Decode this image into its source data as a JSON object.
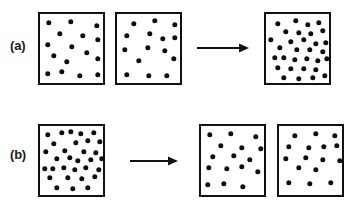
{
  "figure": {
    "background_color": "#ffffff",
    "box_border_color": "#111111",
    "particle_color": "#0d0d0d",
    "label_color": "#1a1a1a",
    "particle_diameter": 5.4,
    "canvas": {
      "width": 361,
      "height": 205
    }
  },
  "rows": [
    {
      "id": "row-a",
      "label": "(a)",
      "label_pos": {
        "x": 10,
        "y": 38
      },
      "description": "Two separate containers of particles combine into one container",
      "boxes": [
        {
          "id": "a-box-1",
          "role": "source-left",
          "rect": {
            "x": 38,
            "y": 12,
            "w": 67,
            "h": 73
          },
          "count": 15,
          "particles": [
            {
              "x": 9,
              "y": 9
            },
            {
              "x": 31,
              "y": 8
            },
            {
              "x": 57,
              "y": 12
            },
            {
              "x": 20,
              "y": 20
            },
            {
              "x": 43,
              "y": 22
            },
            {
              "x": 8,
              "y": 31
            },
            {
              "x": 58,
              "y": 26
            },
            {
              "x": 32,
              "y": 33
            },
            {
              "x": 14,
              "y": 42
            },
            {
              "x": 47,
              "y": 39
            },
            {
              "x": 27,
              "y": 48
            },
            {
              "x": 58,
              "y": 45
            },
            {
              "x": 8,
              "y": 60
            },
            {
              "x": 22,
              "y": 58
            },
            {
              "x": 40,
              "y": 62
            },
            {
              "x": 58,
              "y": 61
            }
          ]
        },
        {
          "id": "a-box-2",
          "role": "source-right",
          "rect": {
            "x": 115,
            "y": 12,
            "w": 67,
            "h": 73
          },
          "count": 15,
          "particles": [
            {
              "x": 17,
              "y": 10
            },
            {
              "x": 38,
              "y": 7
            },
            {
              "x": 58,
              "y": 11
            },
            {
              "x": 10,
              "y": 22
            },
            {
              "x": 33,
              "y": 20
            },
            {
              "x": 46,
              "y": 25
            },
            {
              "x": 58,
              "y": 24
            },
            {
              "x": 8,
              "y": 36
            },
            {
              "x": 31,
              "y": 34
            },
            {
              "x": 48,
              "y": 37
            },
            {
              "x": 22,
              "y": 47
            },
            {
              "x": 57,
              "y": 45
            },
            {
              "x": 10,
              "y": 61
            },
            {
              "x": 32,
              "y": 62
            },
            {
              "x": 50,
              "y": 62
            }
          ]
        },
        {
          "id": "a-box-3",
          "role": "result",
          "rect": {
            "x": 264,
            "y": 12,
            "w": 67,
            "h": 73
          },
          "count": 30,
          "particles": [
            {
              "x": 12,
              "y": 10
            },
            {
              "x": 30,
              "y": 7
            },
            {
              "x": 42,
              "y": 11
            },
            {
              "x": 53,
              "y": 9
            },
            {
              "x": 20,
              "y": 18
            },
            {
              "x": 33,
              "y": 19
            },
            {
              "x": 45,
              "y": 20
            },
            {
              "x": 57,
              "y": 17
            },
            {
              "x": 5,
              "y": 26
            },
            {
              "x": 25,
              "y": 28
            },
            {
              "x": 38,
              "y": 26
            },
            {
              "x": 50,
              "y": 30
            },
            {
              "x": 60,
              "y": 29
            },
            {
              "x": 14,
              "y": 34
            },
            {
              "x": 31,
              "y": 36
            },
            {
              "x": 44,
              "y": 36
            },
            {
              "x": 57,
              "y": 38
            },
            {
              "x": 9,
              "y": 44
            },
            {
              "x": 18,
              "y": 44
            },
            {
              "x": 29,
              "y": 46
            },
            {
              "x": 41,
              "y": 45
            },
            {
              "x": 52,
              "y": 47
            },
            {
              "x": 61,
              "y": 45
            },
            {
              "x": 12,
              "y": 54
            },
            {
              "x": 25,
              "y": 55
            },
            {
              "x": 38,
              "y": 55
            },
            {
              "x": 50,
              "y": 56
            },
            {
              "x": 18,
              "y": 64
            },
            {
              "x": 33,
              "y": 65
            },
            {
              "x": 47,
              "y": 64
            },
            {
              "x": 59,
              "y": 62
            }
          ]
        }
      ],
      "arrow": {
        "id": "a-arrow",
        "direction": "right",
        "rect": {
          "x": 197,
          "y": 42,
          "w": 52,
          "h": 12
        }
      }
    },
    {
      "id": "row-b",
      "label": "(b)",
      "label_pos": {
        "x": 10,
        "y": 147
      },
      "description": "One dense container of particles separates into two containers",
      "boxes": [
        {
          "id": "b-box-1",
          "role": "source",
          "rect": {
            "x": 38,
            "y": 124,
            "w": 67,
            "h": 73
          },
          "count": 30,
          "particles": [
            {
              "x": 8,
              "y": 9
            },
            {
              "x": 22,
              "y": 7
            },
            {
              "x": 31,
              "y": 6
            },
            {
              "x": 41,
              "y": 8
            },
            {
              "x": 54,
              "y": 7
            },
            {
              "x": 14,
              "y": 18
            },
            {
              "x": 36,
              "y": 17
            },
            {
              "x": 48,
              "y": 15
            },
            {
              "x": 60,
              "y": 16
            },
            {
              "x": 6,
              "y": 26
            },
            {
              "x": 25,
              "y": 25
            },
            {
              "x": 44,
              "y": 26
            },
            {
              "x": 56,
              "y": 27
            },
            {
              "x": 17,
              "y": 33
            },
            {
              "x": 30,
              "y": 32
            },
            {
              "x": 38,
              "y": 35
            },
            {
              "x": 51,
              "y": 34
            },
            {
              "x": 62,
              "y": 33
            },
            {
              "x": 5,
              "y": 43
            },
            {
              "x": 13,
              "y": 43
            },
            {
              "x": 24,
              "y": 42
            },
            {
              "x": 35,
              "y": 44
            },
            {
              "x": 46,
              "y": 42
            },
            {
              "x": 59,
              "y": 44
            },
            {
              "x": 10,
              "y": 52
            },
            {
              "x": 28,
              "y": 52
            },
            {
              "x": 42,
              "y": 53
            },
            {
              "x": 55,
              "y": 51
            },
            {
              "x": 17,
              "y": 62
            },
            {
              "x": 33,
              "y": 63
            },
            {
              "x": 48,
              "y": 62
            }
          ]
        },
        {
          "id": "b-box-2",
          "role": "result-left",
          "rect": {
            "x": 199,
            "y": 124,
            "w": 67,
            "h": 73
          },
          "count": 15,
          "particles": [
            {
              "x": 9,
              "y": 9
            },
            {
              "x": 30,
              "y": 8
            },
            {
              "x": 55,
              "y": 11
            },
            {
              "x": 20,
              "y": 20
            },
            {
              "x": 41,
              "y": 22
            },
            {
              "x": 60,
              "y": 23
            },
            {
              "x": 12,
              "y": 31
            },
            {
              "x": 33,
              "y": 30
            },
            {
              "x": 49,
              "y": 34
            },
            {
              "x": 8,
              "y": 42
            },
            {
              "x": 26,
              "y": 43
            },
            {
              "x": 41,
              "y": 41
            },
            {
              "x": 57,
              "y": 46
            },
            {
              "x": 7,
              "y": 59
            },
            {
              "x": 23,
              "y": 58
            },
            {
              "x": 42,
              "y": 61
            }
          ]
        },
        {
          "id": "b-box-3",
          "role": "result-right",
          "rect": {
            "x": 277,
            "y": 124,
            "w": 67,
            "h": 73
          },
          "count": 15,
          "particles": [
            {
              "x": 16,
              "y": 10
            },
            {
              "x": 37,
              "y": 8
            },
            {
              "x": 56,
              "y": 10
            },
            {
              "x": 10,
              "y": 21
            },
            {
              "x": 30,
              "y": 22
            },
            {
              "x": 45,
              "y": 21
            },
            {
              "x": 58,
              "y": 20
            },
            {
              "x": 7,
              "y": 33
            },
            {
              "x": 27,
              "y": 32
            },
            {
              "x": 44,
              "y": 34
            },
            {
              "x": 61,
              "y": 35
            },
            {
              "x": 20,
              "y": 42
            },
            {
              "x": 37,
              "y": 44
            },
            {
              "x": 10,
              "y": 57
            },
            {
              "x": 31,
              "y": 58
            },
            {
              "x": 52,
              "y": 57
            }
          ]
        }
      ],
      "arrow": {
        "id": "b-arrow",
        "direction": "right",
        "rect": {
          "x": 130,
          "y": 155,
          "w": 48,
          "h": 12
        }
      }
    }
  ]
}
